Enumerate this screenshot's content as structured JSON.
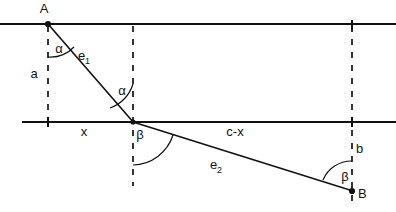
{
  "figure": {
    "type": "geometry-diagram",
    "points": [
      {
        "name": "A",
        "label": "A",
        "x": 48,
        "y": 24
      },
      {
        "name": "B",
        "label": "B",
        "x": 352,
        "y": 191
      },
      {
        "name": "P",
        "label": "",
        "x": 133,
        "y": 122
      }
    ],
    "labels": [
      {
        "id": "point-a",
        "text": "A",
        "x": 44,
        "y": 13
      },
      {
        "id": "point-b",
        "text": "B",
        "x": 358,
        "y": 198
      },
      {
        "id": "segment-a",
        "text": "a",
        "x": 34,
        "y": 78
      },
      {
        "id": "segment-b",
        "text": "b",
        "x": 356,
        "y": 153
      },
      {
        "id": "segment-x",
        "text": "x",
        "x": 84,
        "y": 136
      },
      {
        "id": "segment-c-minus-x",
        "text": "c-x",
        "x": 228,
        "y": 136
      },
      {
        "id": "angle-alpha-top",
        "text": "α",
        "x": 54,
        "y": 53
      },
      {
        "id": "angle-alpha-mid",
        "text": "α",
        "x": 118,
        "y": 95
      },
      {
        "id": "angle-beta-mid",
        "text": "β",
        "x": 136,
        "y": 139
      },
      {
        "id": "angle-beta-bottom",
        "text": "β",
        "x": 341,
        "y": 181
      }
    ],
    "ray_labels": [
      {
        "id": "ray-e1",
        "base": "e",
        "subscript": "1",
        "x": 84,
        "y": 60
      },
      {
        "id": "ray-e2",
        "base": "e",
        "subscript": "2",
        "x": 216,
        "y": 169
      }
    ],
    "lines": {
      "upper_horizontal": {
        "x1": 0,
        "y1": 24,
        "x2": 396,
        "y2": 24
      },
      "lower_horizontal": {
        "x1": 22,
        "y1": 122,
        "x2": 396,
        "y2": 122
      },
      "ray_e1": {
        "x1": 48,
        "y1": 24,
        "x2": 133,
        "y2": 122
      },
      "ray_e2": {
        "x1": 133,
        "y1": 122,
        "x2": 352,
        "y2": 191
      }
    },
    "dashed_verticals": [
      {
        "id": "dashed-vertical-left",
        "x": 48,
        "y1": 24,
        "y2": 122
      },
      {
        "id": "dashed-vertical-middle",
        "x": 133,
        "y1": 24,
        "y2": 186
      },
      {
        "id": "dashed-vertical-right",
        "x": 352,
        "y1": 24,
        "y2": 206
      }
    ],
    "colors": {
      "stroke": "#111111",
      "background": "#ffffff"
    }
  }
}
